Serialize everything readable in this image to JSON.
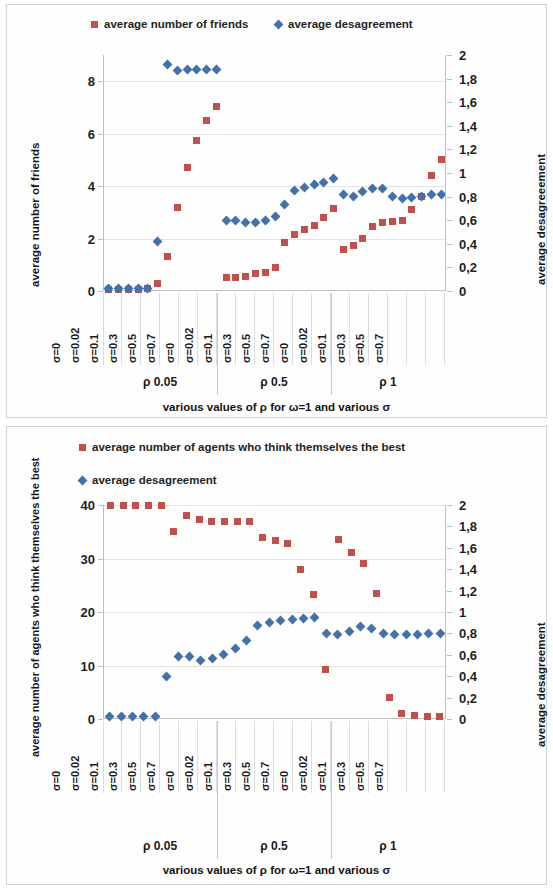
{
  "chart_data": [
    {
      "id": "chart1",
      "type": "scatter",
      "title": "",
      "xlabel": "various values of ρ for ω=1 and various σ",
      "ylabel": "average number of friends",
      "y2label": "average desagreeement",
      "ylim": [
        0,
        9
      ],
      "yticks": [
        "0",
        "2",
        "4",
        "6",
        "8"
      ],
      "ytickvals": [
        0,
        2,
        4,
        6,
        8
      ],
      "y2lim": [
        0,
        2
      ],
      "y2ticks": [
        "0",
        "0,2",
        "0,4",
        "0,6",
        "0,8",
        "1",
        "1,2",
        "1,4",
        "1,6",
        "1,8",
        "2"
      ],
      "y2tickvals": [
        0,
        0.2,
        0.4,
        0.6,
        0.8,
        1.0,
        1.2,
        1.4,
        1.6,
        1.8,
        2.0
      ],
      "categories": [
        "σ=0",
        "σ=0.02",
        "σ=0.1",
        "σ=0.3",
        "σ=0.5",
        "σ=0.7",
        "σ=0",
        "σ=0.02",
        "σ=0.1",
        "σ=0.3",
        "σ=0.5",
        "σ=0.7",
        "σ=0",
        "σ=0.02",
        "σ=0.1",
        "σ=0.3",
        "σ=0.5",
        "σ=0.7"
      ],
      "groups": [
        {
          "label": "ρ 0.05",
          "start": 0,
          "end": 5
        },
        {
          "label": "ρ 0.5",
          "start": 6,
          "end": 11
        },
        {
          "label": "ρ 1",
          "start": 12,
          "end": 17
        }
      ],
      "series": [
        {
          "name": "average number of friends",
          "color": "#c0504d",
          "marker": "square",
          "axis": "left",
          "values": [
            0.05,
            0.05,
            0.05,
            0.08,
            0.1,
            0.3,
            1.3,
            3.2,
            4.7,
            5.75,
            6.5,
            7.05,
            0.5,
            0.5,
            0.55,
            0.65,
            0.7,
            0.9
          ]
        },
        {
          "name": "average desagreement",
          "color": "#4472a8",
          "marker": "diamond",
          "axis": "right",
          "values": [
            0.02,
            0.02,
            0.02,
            0.02,
            0.02,
            0.02,
            0.42,
            1.92,
            1.87,
            1.88,
            1.88,
            1.88,
            1.88,
            0.6,
            0.6,
            0.58,
            0.58,
            0.6
          ]
        }
      ],
      "series_full": [
        {
          "name": "average number of friends",
          "color": "#c0504d",
          "marker": "square",
          "axis": "left",
          "values": [
            0.05,
            0.05,
            0.05,
            0.08,
            0.1,
            0.3,
            1.3,
            3.2,
            4.7,
            5.75,
            6.5,
            7.05,
            0.5,
            0.5,
            0.55,
            0.65,
            0.7,
            0.9
          ]
        }
      ],
      "points_left": [
        0.05,
        0.05,
        0.05,
        0.05,
        0.1,
        0.3,
        1.3,
        3.2,
        4.7,
        5.75,
        6.5,
        7.05,
        0.5,
        0.5,
        0.55,
        0.65,
        0.7,
        0.9,
        1.85,
        2.15,
        2.35,
        2.5,
        2.8,
        3.15,
        1.6,
        1.75,
        2.0,
        2.45,
        2.6,
        2.65,
        2.7,
        3.1,
        3.6,
        4.4,
        5.0
      ],
      "points_right": [
        0.02,
        0.02,
        0.02,
        0.02,
        0.02,
        0.42,
        1.92,
        1.87,
        1.88,
        1.88,
        1.88,
        1.88,
        0.6,
        0.6,
        0.58,
        0.58,
        0.6,
        0.63,
        0.73,
        0.85,
        0.88,
        0.9,
        0.92,
        0.95,
        0.82,
        0.8,
        0.84,
        0.87,
        0.87,
        0.8,
        0.78,
        0.79,
        0.8,
        0.82,
        0.82
      ]
    },
    {
      "id": "chart2",
      "type": "scatter",
      "title": "",
      "xlabel": "various values of ρ for ω=1 and various σ",
      "ylabel": "average number of agents who think themselves the best",
      "y2label": "average desagreement",
      "ylim": [
        0,
        40
      ],
      "yticks": [
        "0",
        "10",
        "20",
        "30",
        "40"
      ],
      "ytickvals": [
        0,
        10,
        20,
        30,
        40
      ],
      "y2lim": [
        0,
        2
      ],
      "y2ticks": [
        "0",
        "0,2",
        "0,4",
        "0,6",
        "0,8",
        "1",
        "1,2",
        "1,4",
        "1,6",
        "1,8",
        "2"
      ],
      "y2tickvals": [
        0,
        0.2,
        0.4,
        0.6,
        0.8,
        1.0,
        1.2,
        1.4,
        1.6,
        1.8,
        2.0
      ],
      "categories": [
        "σ=0",
        "σ=0.02",
        "σ=0.1",
        "σ=0.3",
        "σ=0.5",
        "σ=0.7",
        "σ=0",
        "σ=0.02",
        "σ=0.1",
        "σ=0.3",
        "σ=0.5",
        "σ=0.7",
        "σ=0",
        "σ=0.02",
        "σ=0.1",
        "σ=0.3",
        "σ=0.5",
        "σ=0.7"
      ],
      "groups": [
        {
          "label": "ρ 0.05",
          "start": 0,
          "end": 5
        },
        {
          "label": "ρ 0.5",
          "start": 6,
          "end": 11
        },
        {
          "label": "ρ 1",
          "start": 12,
          "end": 17
        }
      ],
      "points_left": [
        40,
        40,
        40,
        40,
        40,
        35,
        38,
        37.2,
        37,
        37,
        37,
        37,
        34,
        33.3,
        32.8,
        28,
        23.2,
        9.3,
        33.5,
        31.2,
        29.1,
        23.5,
        4.1,
        1.0,
        0.6,
        0.5,
        0.5
      ],
      "points_right": [
        0.02,
        0.02,
        0.02,
        0.02,
        0.02,
        0.4,
        0.58,
        0.58,
        0.55,
        0.57,
        0.6,
        0.66,
        0.73,
        0.87,
        0.9,
        0.92,
        0.93,
        0.94,
        0.95,
        0.8,
        0.79,
        0.82,
        0.86,
        0.85,
        0.8,
        0.79,
        0.79,
        0.79,
        0.8,
        0.8
      ]
    }
  ],
  "chart1": {
    "legend": [
      {
        "label": "average number of friends",
        "marker": "square",
        "color": "#c0504d"
      },
      {
        "label": "average desagreement",
        "marker": "diamond",
        "color": "#4472a8"
      }
    ],
    "y_axis_title": "average number of friends",
    "y2_axis_title": "average desagreeement",
    "x_axis_title": "various values of ρ for ω=1 and various σ"
  },
  "chart2": {
    "legend": [
      {
        "label": "average number of agents who think themselves the best",
        "marker": "square",
        "color": "#c0504d"
      },
      {
        "label": "average desagreement",
        "marker": "diamond",
        "color": "#4472a8"
      }
    ],
    "y_axis_title": "average number of agents who think themselves the best",
    "y2_axis_title": "average desagreement",
    "x_axis_title": "various values of ρ for ω=1 and various σ"
  },
  "colors": {
    "series_red": "#c0504d",
    "series_blue": "#4472a8",
    "grid": "#e2e2e2",
    "axis": "#bfbfbf"
  }
}
